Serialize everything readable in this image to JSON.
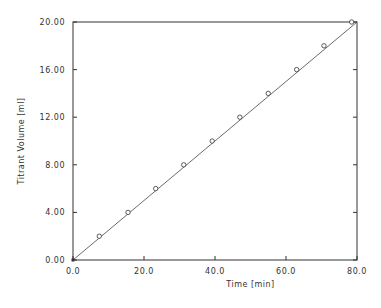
{
  "chart_data": {
    "type": "line",
    "title": "",
    "xlabel": "Time [min]",
    "ylabel": "Titrant Volume [ml]",
    "xlim": [
      0,
      80
    ],
    "ylim": [
      0,
      20
    ],
    "x_ticks": [
      "0.0",
      "20.0",
      "40.0",
      "60.0",
      "80.0"
    ],
    "y_ticks": [
      "0.00",
      "4.00",
      "8.00",
      "12.00",
      "16.00",
      "20.00"
    ],
    "grid": false,
    "legend": null,
    "series": [
      {
        "name": "measured",
        "marker": "open-circle",
        "x": [
          0,
          7.4,
          15.5,
          23.3,
          31.2,
          39.2,
          47.0,
          55.0,
          63.0,
          70.7,
          78.5
        ],
        "y": [
          0,
          2,
          4,
          6,
          8,
          10,
          12,
          14,
          16,
          18,
          20
        ]
      },
      {
        "name": "fit",
        "style": "line",
        "x": [
          0,
          80
        ],
        "y": [
          0,
          20.35
        ]
      }
    ]
  }
}
